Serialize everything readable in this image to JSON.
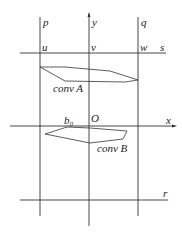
{
  "diagram": {
    "labels": {
      "p": "p",
      "y": "y",
      "q": "q",
      "u": "u",
      "v": "v",
      "w": "w",
      "s": "s",
      "convA": "conv A",
      "b0_base": "b",
      "b0_sub": "0",
      "O": "O",
      "x": "x",
      "convB": "conv B",
      "r": "r"
    },
    "lines": {
      "vertical": [
        {
          "name": "p",
          "x": 40,
          "y1": 17,
          "y2": 216
        },
        {
          "name": "y-axis",
          "x": 89,
          "y1": 14,
          "y2": 226
        },
        {
          "name": "q",
          "x": 138,
          "y1": 17,
          "y2": 216
        }
      ],
      "horizontal": [
        {
          "name": "s",
          "y": 53,
          "x1": 20,
          "x2": 166
        },
        {
          "name": "x-axis",
          "y": 126,
          "x1": 10,
          "x2": 175
        },
        {
          "name": "r",
          "y": 200,
          "x1": 20,
          "x2": 168
        }
      ]
    },
    "polygons": {
      "convA": "40,67 65,67 110,71 138,80 125,82 65,81",
      "convB": "45,134 67,127 90,128 127,131 123,139 90,143"
    },
    "colors": {
      "stroke": "#333333",
      "text": "#222222"
    }
  }
}
